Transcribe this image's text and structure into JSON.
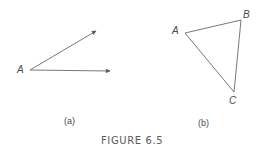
{
  "figure": {
    "title": "FIGURE 6.5",
    "stroke_color": "#6a6a6a",
    "text_color": "#4a4a4a"
  },
  "panel_a": {
    "caption": "(a)",
    "vertex_label": "A",
    "vertex": [
      30,
      70
    ],
    "rays": [
      {
        "end": [
          96,
          31
        ]
      },
      {
        "end": [
          110,
          71
        ]
      }
    ]
  },
  "panel_b": {
    "caption": "(b)",
    "vertices": [
      {
        "label": "A",
        "point": [
          185,
          33
        ]
      },
      {
        "label": "B",
        "point": [
          241,
          20
        ]
      },
      {
        "label": "C",
        "point": [
          234,
          92
        ]
      }
    ]
  }
}
